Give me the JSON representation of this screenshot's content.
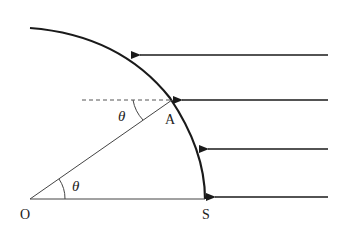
{
  "labels": {
    "origin": "O",
    "point_a": "A",
    "point_s": "S",
    "angle_at_o": "θ",
    "angle_at_a": "θ"
  },
  "colors": {
    "stroke": "#1a1a1a",
    "background": "#ffffff"
  }
}
